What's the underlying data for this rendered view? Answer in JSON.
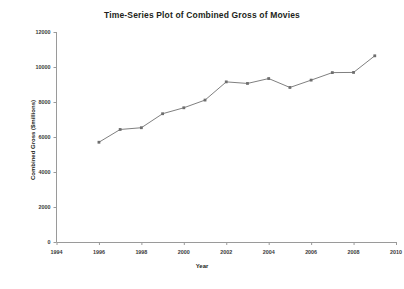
{
  "chart_data": {
    "type": "line",
    "title": "Time-Series  Plot of Combined Gross of Movies",
    "xlabel": "Year",
    "ylabel": "Combined Gross  ($millions)",
    "x": [
      1996,
      1997,
      1998,
      1999,
      2000,
      2001,
      2002,
      2003,
      2004,
      2005,
      2006,
      2007,
      2008,
      2009
    ],
    "values": [
      5700,
      6430,
      6530,
      7330,
      7670,
      8110,
      9150,
      9060,
      9340,
      8830,
      9250,
      9680,
      9690,
      10640
    ],
    "series": [
      {
        "name": "Combined Gross",
        "values": [
          5700,
          6430,
          6530,
          7330,
          7670,
          8110,
          9150,
          9060,
          9340,
          8830,
          9250,
          9680,
          9690,
          10640
        ]
      }
    ],
    "xlim": [
      1994,
      2010
    ],
    "ylim": [
      0,
      12000
    ],
    "xticks": [
      1994,
      1996,
      1998,
      2000,
      2002,
      2004,
      2006,
      2008,
      2010
    ],
    "yticks": [
      0,
      2000,
      4000,
      6000,
      8000,
      10000,
      12000
    ],
    "xtick_labels": [
      "1994",
      "1996",
      "1998",
      "2000",
      "2002",
      "2004",
      "2006",
      "2008",
      "2010"
    ],
    "ytick_labels": [
      "0",
      "2000",
      "4000",
      "6000",
      "8000",
      "10000",
      "12000"
    ],
    "grid": false,
    "legend": "none",
    "line_color": "#808080",
    "marker_color": "#6e6e6e",
    "axis_color": "#9a9a9a",
    "background": "#ffffff"
  }
}
